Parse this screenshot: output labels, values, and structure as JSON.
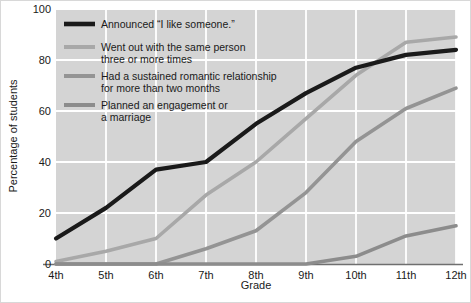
{
  "chart_data": {
    "type": "line",
    "title": "",
    "xlabel": "Grade",
    "ylabel": "Percentage of students",
    "categories": [
      "4th",
      "5th",
      "6th",
      "7th",
      "8th",
      "9th",
      "10th",
      "11th",
      "12th"
    ],
    "xtick_labels": [
      "4th",
      "5th",
      "6th",
      "7th",
      "8th",
      "9th",
      "10th",
      "11th",
      "12th"
    ],
    "ytick_labels": [
      "0",
      "20",
      "40",
      "60",
      "80",
      "100"
    ],
    "ytick_values": [
      0,
      20,
      40,
      60,
      80,
      100
    ],
    "ylim": [
      0,
      100
    ],
    "grid": true,
    "grid_color": "#ffffff",
    "plot_background": "#d4d4d4",
    "legend_position": "top-left inside plot",
    "series": [
      {
        "name": "Announced “I like someone.”",
        "color": "#1a1a1a",
        "values": [
          10,
          22,
          37,
          40,
          55,
          67,
          77,
          82,
          84
        ]
      },
      {
        "name": "Went out with the same person three or more times",
        "color": "#a8a8a8",
        "values": [
          1,
          5,
          10,
          27,
          40,
          57,
          74,
          87,
          89
        ]
      },
      {
        "name": "Had a sustained romantic relationship for more than two months",
        "color": "#949494",
        "values": [
          0,
          0,
          0,
          6,
          13,
          28,
          48,
          61,
          69
        ]
      },
      {
        "name": "Planned an engagement or a marriage",
        "color": "#8c8c8c",
        "values": [
          0,
          0,
          0,
          0,
          0,
          0,
          3,
          11,
          15
        ]
      }
    ]
  },
  "legend": {
    "entries": [
      {
        "label_line1": "Announced “I like someone.”",
        "label_line2": ""
      },
      {
        "label_line1": "Went out with the same person",
        "label_line2": "three or more times"
      },
      {
        "label_line1": "Had a sustained romantic relationship",
        "label_line2": "for more than two months"
      },
      {
        "label_line1": "Planned an engagement or",
        "label_line2": "a marriage"
      }
    ]
  },
  "axes": {
    "x_title": "Grade",
    "y_title": "Percentage of students"
  }
}
